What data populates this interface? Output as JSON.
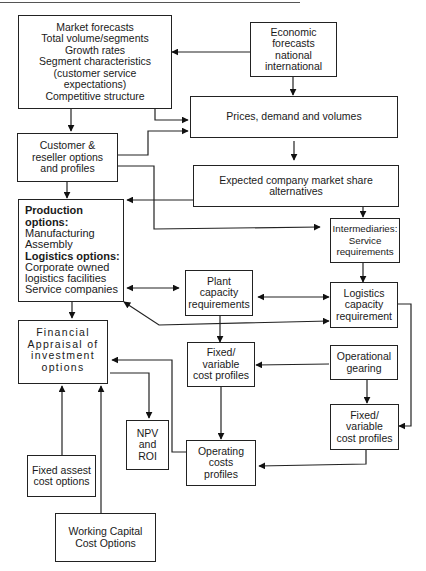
{
  "diagram": {
    "nodes": {
      "market_forecasts": {
        "lines": [
          "Market forecasts",
          "Total volume/segments",
          "Growth rates",
          "Segment characteristics",
          "(customer service",
          "expectations)",
          "Competitive structure"
        ]
      },
      "economic_forecasts": {
        "lines": [
          "Economic",
          "forecasts",
          "national",
          "international"
        ]
      },
      "prices_demand": {
        "lines": [
          "Prices, demand and volumes"
        ]
      },
      "customer_reseller": {
        "lines": [
          "Customer &",
          "reseller options",
          "and profiles"
        ]
      },
      "market_share": {
        "lines": [
          "Expected company market share",
          "alternatives"
        ]
      },
      "production_options": {
        "heading1": "Production options:",
        "items1": [
          "Manufacturing",
          "Assembly"
        ],
        "heading2": "Logistics options:",
        "items2": [
          "Corporate owned",
          "logistics facilities",
          "Service companies"
        ]
      },
      "intermediaries": {
        "lines": [
          "Intermediaries:",
          "Service",
          "requirements"
        ]
      },
      "plant_capacity": {
        "lines": [
          "Plant",
          "capacity",
          "requirements"
        ]
      },
      "logistics_capacity": {
        "lines": [
          "Logistics",
          "capacity",
          "requirement"
        ]
      },
      "financial_appraisal": {
        "lines": [
          "Financial",
          "Appraisal of",
          "investment",
          "options"
        ]
      },
      "fixed_variable_1": {
        "lines": [
          "Fixed/",
          "variable",
          "cost profiles"
        ]
      },
      "operational_gearing": {
        "lines": [
          "Operational",
          "gearing"
        ]
      },
      "fixed_variable_2": {
        "lines": [
          "Fixed/",
          "variable",
          "cost profiles"
        ]
      },
      "npv_roi": {
        "lines": [
          "NPV",
          "and",
          "ROI"
        ]
      },
      "operating_costs": {
        "lines": [
          "Operating",
          "costs",
          "profiles"
        ]
      },
      "fixed_asset_cost": {
        "lines": [
          "Fixed assest",
          "cost options"
        ]
      },
      "working_capital": {
        "lines": [
          "Working Capital",
          "Cost Options"
        ]
      }
    },
    "edges": [
      {
        "from": "economic_forecasts",
        "to": "market_forecasts"
      },
      {
        "from": "economic_forecasts",
        "to": "prices_demand"
      },
      {
        "from": "market_forecasts",
        "to": "prices_demand"
      },
      {
        "from": "market_forecasts",
        "to": "customer_reseller"
      },
      {
        "from": "customer_reseller",
        "to": "prices_demand"
      },
      {
        "from": "customer_reseller",
        "to": "intermediaries"
      },
      {
        "from": "customer_reseller",
        "to": "production_options"
      },
      {
        "from": "prices_demand",
        "to": "market_share"
      },
      {
        "from": "market_share",
        "to": "production_options"
      },
      {
        "from": "market_share",
        "to": "intermediaries"
      },
      {
        "from": "intermediaries",
        "to": "logistics_capacity"
      },
      {
        "from": "production_options",
        "to": "plant_capacity",
        "bidirectional": true
      },
      {
        "from": "plant_capacity",
        "to": "logistics_capacity",
        "bidirectional": true
      },
      {
        "from": "logistics_capacity",
        "to": "production_options",
        "bidirectional": true
      },
      {
        "from": "production_options",
        "to": "financial_appraisal"
      },
      {
        "from": "plant_capacity",
        "to": "fixed_variable_1"
      },
      {
        "from": "operational_gearing",
        "to": "fixed_variable_1"
      },
      {
        "from": "operational_gearing",
        "to": "fixed_variable_2"
      },
      {
        "from": "logistics_capacity",
        "to": "fixed_variable_2"
      },
      {
        "from": "fixed_variable_1",
        "to": "operating_costs"
      },
      {
        "from": "fixed_variable_2",
        "to": "operating_costs"
      },
      {
        "from": "operating_costs",
        "to": "financial_appraisal"
      },
      {
        "from": "financial_appraisal",
        "to": "npv_roi"
      },
      {
        "from": "fixed_asset_cost",
        "to": "financial_appraisal"
      },
      {
        "from": "working_capital",
        "to": "financial_appraisal"
      }
    ]
  }
}
